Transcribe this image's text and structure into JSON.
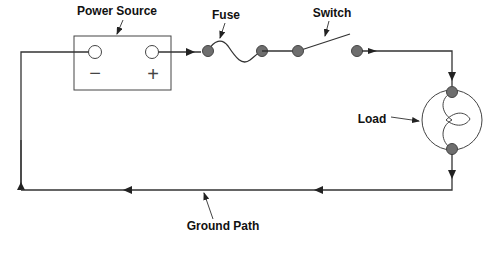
{
  "diagram": {
    "type": "series circuit",
    "labels": {
      "power_source": "Power Source",
      "fuse": "Fuse",
      "switch": "Switch",
      "load": "Load",
      "ground_path": "Ground Path"
    },
    "terminals": {
      "negative": "−",
      "positive": "+"
    },
    "colors": {
      "wire": "#333333",
      "connector_dot": "#6e6e6e",
      "background": "#ffffff"
    },
    "components": [
      "Power Source",
      "Fuse",
      "Switch",
      "Load",
      "Ground Path"
    ],
    "current_flow": "clockwise: positive terminal -> fuse -> switch -> load -> ground path -> negative terminal"
  }
}
